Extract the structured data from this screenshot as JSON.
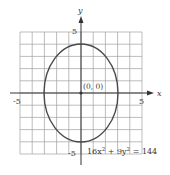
{
  "chart_data": {
    "type": "line",
    "title": "",
    "equation": "16x² + 9y² = 144",
    "equation_parts": {
      "a": "16x",
      "a_exp": "2",
      "b": " + 9y",
      "b_exp": "2",
      "rest": " = 144"
    },
    "center_label": "(0, 0)",
    "center": [
      0,
      0
    ],
    "semi_axis_x": 3,
    "semi_axis_y": 4,
    "xlabel": "x",
    "ylabel": "y",
    "xlim": [
      -5,
      5
    ],
    "ylim": [
      -5,
      5
    ],
    "grid": true,
    "grid_step": 1,
    "tick_labels": {
      "x_min": "-5",
      "x_max": "5",
      "y_min": "-5",
      "y_max": "5"
    },
    "series": [
      {
        "name": "ellipse",
        "points": [
          [
            3,
            0
          ],
          [
            0,
            4
          ],
          [
            -3,
            0
          ],
          [
            0,
            -4
          ]
        ]
      }
    ]
  },
  "colors": {
    "grid": "#9a9a9a",
    "axis": "#3a3a3a",
    "curve": "#4a4a4a"
  }
}
